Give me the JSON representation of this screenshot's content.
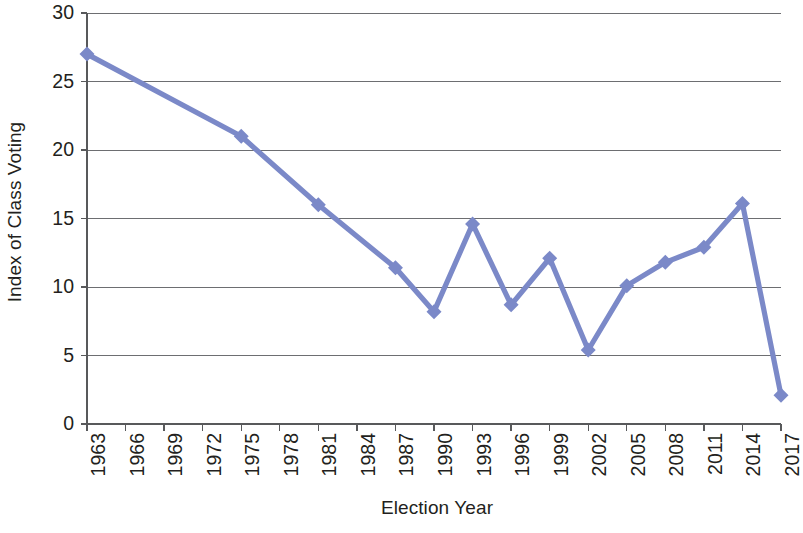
{
  "chart_data": {
    "type": "line",
    "title": "",
    "xlabel": "Election Year",
    "ylabel": "Index of Class Voting",
    "xlim": [
      1963,
      2017
    ],
    "ylim": [
      0,
      30
    ],
    "yticks": [
      0,
      5,
      10,
      15,
      20,
      25,
      30
    ],
    "xticks": [
      "1963",
      "1966",
      "1969",
      "1972",
      "1975",
      "1978",
      "1981",
      "1984",
      "1987",
      "1990",
      "1993",
      "1996",
      "1999",
      "2002",
      "2005",
      "2008",
      "2011",
      "2014",
      "2017"
    ],
    "grid": "horizontal",
    "legend": "none",
    "series": [
      {
        "name": "Index of Class Voting",
        "color": "#7b89c8",
        "marker": "diamond",
        "x": [
          1963,
          1975,
          1981,
          1987,
          1990,
          1993,
          1996,
          1999,
          2002,
          2005,
          2008,
          2011,
          2014,
          2017
        ],
        "values": [
          27.0,
          21.0,
          16.0,
          11.4,
          8.2,
          14.6,
          8.7,
          12.1,
          5.4,
          10.1,
          11.8,
          12.9,
          16.1,
          2.1
        ]
      }
    ]
  },
  "axis": {
    "y_title": "Index of Class Voting",
    "x_title": "Election Year"
  },
  "colors": {
    "series": "#7b89c8",
    "axis": "#58595b",
    "grid": "#6d6e71",
    "text": "#231f20",
    "background": "#ffffff"
  }
}
